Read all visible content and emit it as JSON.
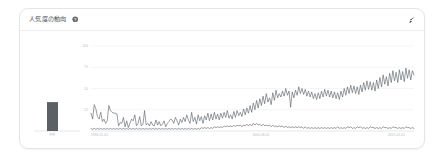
{
  "panel": {
    "title": "人気度の動向",
    "help_icon": "help-circle-icon",
    "expand_icon": "expand-arrow-icon"
  },
  "colors": {
    "card_background": "#ffffff",
    "card_border": "#e3e5e8",
    "header_divider": "#eceef0",
    "title_text": "#4b5157",
    "tick_text": "#b4b8bc",
    "gridline": "#eef0f2",
    "axis": "#d9dcdf",
    "line_series": "#5a6066",
    "bar_fill": "#5c6165"
  },
  "chart_data": {
    "type": "line",
    "title": "人気度の動向",
    "xlabel": "",
    "ylabel": "",
    "grid": true,
    "legend_position": "none",
    "ylim": [
      0,
      100
    ],
    "yticks": [
      25,
      50,
      75,
      100
    ],
    "ytick_labels": [
      "25",
      "50",
      "75",
      "100"
    ],
    "xtick_labels": [
      "1994-01-01",
      "2004-08-01",
      "2015-03-01"
    ],
    "xtick_positions": [
      0,
      0.5,
      1
    ],
    "bar_panel": {
      "type": "bar",
      "categories": [
        "平均"
      ],
      "values": [
        34
      ],
      "ylim": [
        0,
        100
      ]
    },
    "series": [
      {
        "name": "series-rising",
        "values": [
          21,
          14,
          31,
          26,
          17,
          14,
          22,
          11,
          14,
          9,
          12,
          30,
          24,
          22,
          21,
          21,
          20,
          6,
          10,
          9,
          16,
          5,
          12,
          4,
          9,
          14,
          12,
          19,
          6,
          9,
          17,
          6,
          8,
          24,
          7,
          9,
          6,
          11,
          7,
          6,
          13,
          7,
          11,
          6,
          8,
          12,
          5,
          9,
          11,
          14,
          13,
          9,
          16,
          12,
          7,
          14,
          10,
          16,
          11,
          19,
          13,
          9,
          22,
          11,
          16,
          8,
          19,
          12,
          17,
          9,
          18,
          13,
          21,
          12,
          20,
          13,
          22,
          14,
          20,
          13,
          21,
          15,
          22,
          16,
          24,
          15,
          19,
          14,
          23,
          16,
          24,
          18,
          22,
          17,
          26,
          19,
          27,
          21,
          30,
          22,
          33,
          25,
          36,
          27,
          38,
          30,
          41,
          32,
          44,
          34,
          39,
          31,
          45,
          36,
          48,
          39,
          44,
          40,
          47,
          41,
          50,
          42,
          47,
          28,
          46,
          39,
          48,
          42,
          52,
          44,
          50,
          43,
          49,
          41,
          47,
          40,
          46,
          38,
          44,
          37,
          45,
          38,
          47,
          40,
          49,
          41,
          48,
          40,
          47,
          39,
          46,
          38,
          45,
          37,
          47,
          40,
          50,
          42,
          52,
          44,
          54,
          45,
          53,
          44,
          52,
          43,
          54,
          46,
          57,
          48,
          59,
          49,
          58,
          48,
          57,
          47,
          60,
          50,
          63,
          52,
          66,
          55,
          64,
          53,
          68,
          57,
          71,
          59,
          69,
          57,
          72,
          60,
          70,
          58,
          74,
          62,
          72,
          60,
          71,
          66
        ]
      },
      {
        "name": "series-flat",
        "values": [
          3,
          2,
          3,
          2,
          3,
          2,
          3,
          2,
          3,
          2,
          3,
          2,
          3,
          2,
          3,
          2,
          3,
          2,
          3,
          2,
          3,
          2,
          3,
          2,
          3,
          2,
          3,
          2,
          3,
          2,
          3,
          2,
          3,
          2,
          3,
          2,
          3,
          2,
          3,
          2,
          3,
          2,
          3,
          2,
          3,
          2,
          3,
          2,
          3,
          2,
          3,
          2,
          3,
          2,
          3,
          2,
          3,
          2,
          3,
          2,
          3,
          2,
          3,
          2,
          3,
          2,
          3,
          2,
          4,
          3,
          4,
          3,
          4,
          3,
          4,
          3,
          5,
          4,
          5,
          4,
          5,
          4,
          6,
          5,
          6,
          5,
          6,
          5,
          7,
          5,
          7,
          6,
          7,
          5,
          7,
          6,
          8,
          6,
          8,
          6,
          9,
          7,
          9,
          7,
          8,
          6,
          8,
          6,
          7,
          6,
          7,
          5,
          7,
          5,
          6,
          5,
          6,
          5,
          6,
          4,
          6,
          4,
          5,
          4,
          5,
          4,
          5,
          4,
          5,
          4,
          5,
          3,
          5,
          3,
          4,
          3,
          4,
          3,
          4,
          3,
          4,
          3,
          4,
          3,
          4,
          3,
          4,
          3,
          4,
          3,
          4,
          3,
          5,
          3,
          4,
          3,
          4,
          3,
          5,
          4,
          5,
          3,
          4,
          3,
          5,
          4,
          5,
          3,
          4,
          3,
          4,
          3,
          5,
          4,
          4,
          3,
          4,
          3,
          4,
          3,
          5,
          4,
          4,
          3,
          4,
          3,
          5,
          4,
          4,
          3,
          4,
          3,
          4,
          3,
          5,
          4,
          4,
          3,
          4,
          3
        ]
      }
    ]
  }
}
